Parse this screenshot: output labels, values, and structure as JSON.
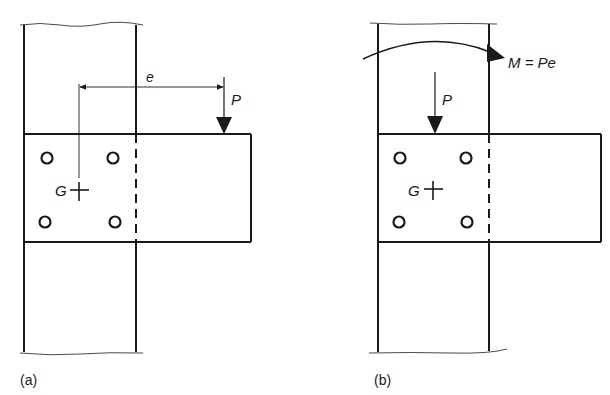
{
  "figure": {
    "panel_a": {
      "caption": "(a)",
      "eccentricity_label": "e",
      "load_label": "P",
      "centroid_label": "G",
      "bolt_count": 4
    },
    "panel_b": {
      "caption": "(b)",
      "moment_label": "M = Pe",
      "load_label": "P",
      "centroid_label": "G",
      "bolt_count": 4
    },
    "colors": {
      "ink": "#1a1a1a",
      "background": "#ffffff"
    }
  }
}
